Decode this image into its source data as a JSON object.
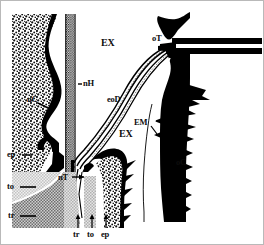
{
  "figure": {
    "type": "anatomical-line-diagram",
    "title_visible": false,
    "background_color": "#ffffff",
    "border_color": "#b9b9b9",
    "width_px": 264,
    "height_px": 245,
    "ink_color": "#000000"
  },
  "labels": [
    {
      "id": "nC",
      "text": "nC",
      "x": 41,
      "y": 100,
      "size": "sm",
      "leader": "left-dash"
    },
    {
      "id": "nH",
      "text": "nH",
      "x": 83,
      "y": 82,
      "size": "sm",
      "leader": "left-dash"
    },
    {
      "id": "EX1",
      "text": "EX",
      "x": 104,
      "y": 44,
      "size": "md",
      "leader": "none"
    },
    {
      "id": "eoD",
      "text": "eoD",
      "x": 109,
      "y": 99,
      "size": "sm",
      "leader": "none"
    },
    {
      "id": "EX2",
      "text": "EX",
      "x": 122,
      "y": 134,
      "size": "md",
      "leader": "none"
    },
    {
      "id": "EM",
      "text": "EM",
      "x": 136,
      "y": 122,
      "size": "sm",
      "leader": "diagonal"
    },
    {
      "id": "oT",
      "text": "oT",
      "x": 155,
      "y": 38,
      "size": "sm",
      "leader": "none"
    },
    {
      "id": "oC",
      "text": "oC",
      "x": 176,
      "y": 161,
      "size": "sm",
      "leader": "left-dash"
    },
    {
      "id": "ep1",
      "text": "ep",
      "x": 8,
      "y": 153,
      "size": "sm",
      "leader": "right-dash"
    },
    {
      "id": "to1",
      "text": "to",
      "x": 8,
      "y": 185,
      "size": "sm",
      "leader": "right-dash"
    },
    {
      "id": "tr1",
      "text": "tr",
      "x": 9,
      "y": 214,
      "size": "sm",
      "leader": "right-dash"
    },
    {
      "id": "tr2",
      "text": "tr",
      "x": 74,
      "y": 231,
      "size": "sm",
      "leader": "up-arrow"
    },
    {
      "id": "to2",
      "text": "to",
      "x": 89,
      "y": 231,
      "size": "sm",
      "leader": "up-arrow"
    },
    {
      "id": "ep2",
      "text": "ep",
      "x": 103,
      "y": 231,
      "size": "sm",
      "leader": "up-arrow"
    }
  ],
  "structures": [
    {
      "name": "nasal-cavity-wall",
      "key": "nC",
      "fill": "stipple",
      "note": "left stippled mass with thick black margin"
    },
    {
      "name": "nasal-duct-tube",
      "key": "nH",
      "fill": "hatch-vert",
      "note": "central vertical striped tube"
    },
    {
      "name": "exterior-space-upper",
      "key": "EX",
      "fill": "white",
      "note": "open white region upper centre"
    },
    {
      "name": "exterior-space-lower",
      "key": "EX",
      "fill": "white",
      "note": "open white region lower centre"
    },
    {
      "name": "eccrine-outflow-ducts",
      "key": "eoD",
      "fill": "striped",
      "note": "curved bundle of parallel ducts"
    },
    {
      "name": "external-membrane",
      "key": "EM",
      "fill": "thin-line",
      "note": "thin pale line inside black cuticle"
    },
    {
      "name": "outer-tube",
      "key": "oT",
      "fill": "solid",
      "note": "horizontal black tube to right edge"
    },
    {
      "name": "outer-cuticle",
      "key": "oC",
      "fill": "solid",
      "note": "thick black spined cuticle right"
    },
    {
      "name": "epidermis",
      "key": "ep",
      "fill": "stipple",
      "note": "stippled epidermal layers"
    },
    {
      "name": "tonofibril-layer",
      "key": "to",
      "fill": "light-grey",
      "note": "light grey banded layer"
    },
    {
      "name": "trabecular-layer",
      "key": "tr",
      "fill": "cross-hatch",
      "note": "dark cross-hatched layer"
    }
  ]
}
